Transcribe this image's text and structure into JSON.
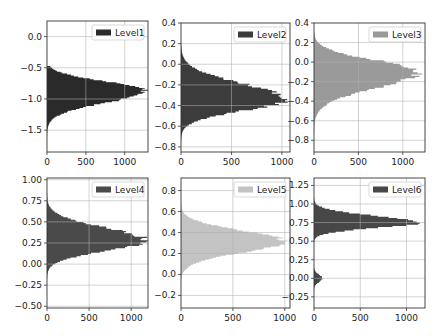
{
  "chart_data": [
    {
      "type": "bar",
      "orientation": "horizontal-histogram",
      "legend": "Level1",
      "color": "#2a2a2a",
      "ylim": [
        -1.85,
        0.25
      ],
      "yticks": [
        0.0,
        -0.5,
        -1.0,
        -1.5
      ],
      "yticklabels": [
        "0.0",
        "−0.5",
        "−1.0",
        "−1.5"
      ],
      "xlim": [
        0,
        1300
      ],
      "xticks": [
        0,
        500,
        1000
      ],
      "xticklabels": [
        "0",
        "500",
        "1000"
      ],
      "center": -0.87,
      "peak": 1260,
      "spread_low": 0.42,
      "spread_high": 0.33,
      "range": [
        -1.85,
        -0.47
      ],
      "grid": true,
      "legend_position": "upper right"
    },
    {
      "type": "bar",
      "orientation": "horizontal-histogram",
      "legend": "Level2",
      "color": "#3c3c3c",
      "ylim": [
        -0.85,
        0.4
      ],
      "yticks": [
        0.4,
        0.2,
        0.0,
        -0.2,
        -0.4,
        -0.6,
        -0.8
      ],
      "yticklabels": [
        "0.4",
        "0.2",
        "0.0",
        "−0.2",
        "−0.4",
        "−0.6",
        "−0.8"
      ],
      "xlim": [
        0,
        1080
      ],
      "xticks": [
        0,
        500,
        1000
      ],
      "xticklabels": [
        "0",
        "500",
        "1000"
      ],
      "center": -0.34,
      "peak": 1040,
      "spread_low": 0.24,
      "spread_high": 0.33,
      "range": [
        -0.8,
        0.3
      ],
      "grid": true,
      "legend_position": "upper right"
    },
    {
      "type": "bar",
      "orientation": "horizontal-histogram",
      "legend": "Level3",
      "color": "#9a9a9a",
      "ylim": [
        -0.92,
        0.4
      ],
      "yticks": [
        0.4,
        0.2,
        0.0,
        -0.2,
        -0.4,
        -0.6,
        -0.8
      ],
      "yticklabels": [
        "0.4",
        "0.2",
        "0.0",
        "−0.2",
        "−0.4",
        "−0.6",
        "−0.8"
      ],
      "xlim": [
        0,
        1250
      ],
      "xticks": [
        0,
        500,
        1000
      ],
      "xticklabels": [
        "0",
        "500",
        "1000"
      ],
      "center": -0.1,
      "peak": 1180,
      "spread_low": 0.36,
      "spread_high": 0.26,
      "range": [
        -0.8,
        0.3
      ],
      "grid": true,
      "legend_position": "upper right"
    },
    {
      "type": "bar",
      "orientation": "horizontal-histogram",
      "legend": "Level4",
      "color": "#4a4a4a",
      "ylim": [
        -0.52,
        1.02
      ],
      "yticks": [
        1.0,
        0.75,
        0.5,
        0.25,
        0.0,
        -0.25,
        -0.5
      ],
      "yticklabels": [
        "1.00",
        "0.75",
        "0.50",
        "0.25",
        "0.00",
        "−0.25",
        "−0.50"
      ],
      "xlim": [
        0,
        1200
      ],
      "xticks": [
        0,
        500,
        1000
      ],
      "xticklabels": [
        "0",
        "500",
        "1000"
      ],
      "center": 0.28,
      "peak": 1180,
      "spread_low": 0.27,
      "spread_high": 0.33,
      "range": [
        -0.3,
        0.92
      ],
      "grid": true,
      "legend_position": "upper right"
    },
    {
      "type": "bar",
      "orientation": "horizontal-histogram",
      "legend": "Level5",
      "color": "#c3c3c3",
      "ylim": [
        -0.32,
        0.92
      ],
      "yticks": [
        0.8,
        0.6,
        0.4,
        0.2,
        0.0,
        -0.2
      ],
      "yticklabels": [
        "0.8",
        "0.6",
        "0.4",
        "0.2",
        "0.0",
        "−0.2"
      ],
      "xlim": [
        0,
        1050
      ],
      "xticks": [
        0,
        500,
        1000
      ],
      "xticklabels": [
        "0",
        "500",
        "1000"
      ],
      "center": 0.32,
      "peak": 1000,
      "spread_low": 0.24,
      "spread_high": 0.22,
      "range": [
        -0.15,
        0.72
      ],
      "grid": true,
      "legend_position": "upper right"
    },
    {
      "type": "bar",
      "orientation": "horizontal-histogram",
      "legend": "Level6",
      "color": "#474747",
      "ylim": [
        -0.4,
        1.35
      ],
      "yticks": [
        1.25,
        1.0,
        0.75,
        0.5,
        0.25,
        0.0,
        -0.25
      ],
      "yticklabels": [
        "1.25",
        "1.00",
        "0.75",
        "0.50",
        "0.25",
        "0.00",
        "−0.25"
      ],
      "xlim": [
        0,
        1200
      ],
      "xticks": [
        0,
        500,
        1000
      ],
      "xticklabels": [
        "0",
        "500",
        "1000"
      ],
      "center": 0.75,
      "peak": 1140,
      "spread_low": 0.16,
      "spread_high": 0.2,
      "range": [
        -0.2,
        1.18
      ],
      "secondary_bump": {
        "center": 0.0,
        "peak": 90,
        "spread": 0.05
      },
      "grid": true,
      "legend_position": "upper right"
    }
  ],
  "layout": {
    "panels": [
      {
        "x": 47,
        "y": 21,
        "w": 101,
        "h": 131
      },
      {
        "x": 181,
        "y": 23,
        "w": 109,
        "h": 129
      },
      {
        "x": 314,
        "y": 23,
        "w": 111,
        "h": 129
      },
      {
        "x": 47,
        "y": 178,
        "w": 101,
        "h": 130
      },
      {
        "x": 181,
        "y": 178,
        "w": 109,
        "h": 130
      },
      {
        "x": 314,
        "y": 178,
        "w": 111,
        "h": 130
      }
    ]
  }
}
